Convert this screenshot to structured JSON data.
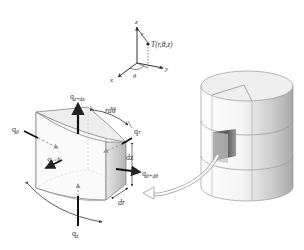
{
  "diagram": {
    "coordinate_system": {
      "axes": [
        "z",
        "y",
        "x"
      ],
      "radius_label": "r",
      "angle_label": "θ",
      "point_label": "T(r,θ,z)"
    },
    "element": {
      "flux_labels": {
        "q_z_dz": "q",
        "q_z_dz_sub": "z+dz",
        "q_theta": "q",
        "q_theta_sub": "θ",
        "q_r_dr": "q",
        "q_r_dr_sub": "r+dr",
        "q_r": "q",
        "q_r_sub": "r",
        "q_theta_dtheta": "q",
        "q_theta_dtheta_sub": "θ+dθ",
        "q_z": "q",
        "q_z_sub": "z"
      },
      "dimension_labels": {
        "arc": "rdθ",
        "height": "dz",
        "radial": "dr"
      }
    },
    "cylinder": {
      "description": "Solid cylinder with a cut-out element, arrow linking to enlarged element"
    },
    "colors": {
      "line": "#333333",
      "face_light": "#f2f2f2",
      "face_mid": "#d6d6d6",
      "face_dark": "#9a9a9a"
    }
  }
}
